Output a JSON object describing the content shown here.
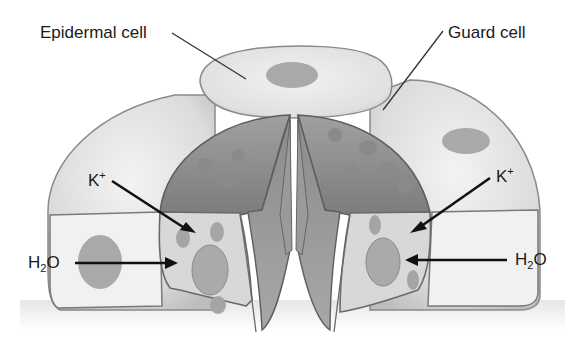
{
  "diagram": {
    "type": "stomata-guard-cell-illustration",
    "labels": {
      "epidermal_cell": "Epidermal cell",
      "guard_cell": "Guard cell",
      "k_left": {
        "base": "K",
        "sup": "+"
      },
      "k_right": {
        "base": "K",
        "sup": "+"
      },
      "h2o_left": {
        "pre": "H",
        "sub": "2",
        "post": "O"
      },
      "h2o_right": {
        "pre": "H",
        "sub": "2",
        "post": "O"
      }
    },
    "arrows": [
      {
        "from": "K+ left label",
        "to": "left guard cell",
        "direction": "inward"
      },
      {
        "from": "H2O left label",
        "to": "left guard cell",
        "direction": "inward"
      },
      {
        "from": "K+ right label",
        "to": "right guard cell",
        "direction": "inward"
      },
      {
        "from": "H2O right label",
        "to": "right guard cell",
        "direction": "inward"
      }
    ],
    "colors": {
      "background": "#ffffff",
      "epidermal_fill": "#e4e4e4",
      "epidermal_cut_face": "#f0f0f0",
      "guard_top": "#8e8e8e",
      "guard_cut_face": "#d6d6d6",
      "nucleus": "#a8a8a8",
      "outline": "#6a6a6a",
      "text": "#1a1a1a",
      "arrow": "#111111"
    }
  }
}
